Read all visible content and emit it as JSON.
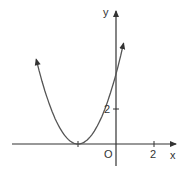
{
  "chart_data": {
    "type": "line",
    "title": "",
    "function": "y = (x + 2)^2",
    "xlabel": "x",
    "ylabel": "y",
    "origin_label": "O",
    "x_ticks": [
      {
        "value": -2,
        "label": ""
      },
      {
        "value": 2,
        "label": "2"
      }
    ],
    "y_ticks": [
      {
        "value": 2,
        "label": "2"
      }
    ],
    "vertex": {
      "x": -2,
      "y": 0
    },
    "y_intercept": 4,
    "x": [
      -4.2,
      -4,
      -3,
      -2,
      -1,
      0,
      0.4
    ],
    "series": [
      {
        "name": "parabola",
        "values": [
          4.84,
          4,
          1,
          0,
          1,
          4,
          5.76
        ]
      }
    ],
    "xlim": [
      -5.5,
      3.1
    ],
    "ylim": [
      -1.2,
      7.6
    ],
    "grid": false,
    "legend": "none",
    "colors": {
      "curve": "#555555",
      "axes": "#333333"
    }
  }
}
